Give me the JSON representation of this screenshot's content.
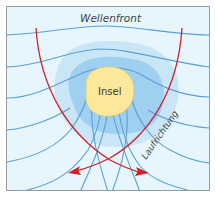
{
  "diagram": {
    "labels": {
      "wavefront": "Wellenfront",
      "island": "Insel",
      "direction": "Laufrichtung"
    },
    "colors": {
      "water_background": "#e6f6fc",
      "shallow_outer": "#c9e6f6",
      "shallow_inner": "#9fd0f0",
      "island_fill": "#fbe89a",
      "wave_lines": "#5b9fd3",
      "ray_lines": "#d0202a",
      "frame_border": "#9a9a9a"
    }
  }
}
